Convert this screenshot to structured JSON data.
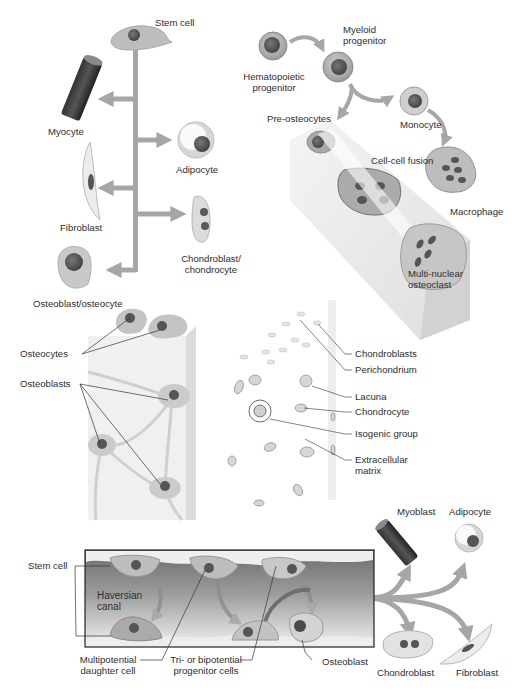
{
  "panel_msc_differentiation": {
    "source": "Stem cell",
    "targets": [
      {
        "label": "Myocyte"
      },
      {
        "label": "Adipocyte"
      },
      {
        "label": "Fibroblast"
      },
      {
        "label": "Chondroblast/",
        "label2": "chondrocyte"
      },
      {
        "label": "Osteoblast/osteocyte"
      }
    ]
  },
  "panel_osteoclast_lineage": {
    "hematopoietic": {
      "line1": "Hematopoietic",
      "line2": "progenitor"
    },
    "myeloid": {
      "line1": "Myeloid",
      "line2": "progenitor"
    },
    "pre_osteocytes": "Pre-osteocytes",
    "monocyte": "Monocyte",
    "fusion": "Cell-cell fusion",
    "macrophage": "Macrophage",
    "osteoclast": {
      "line1": "Multi-nuclear",
      "line2": "osteoclast"
    }
  },
  "panel_bone": {
    "osteocytes": "Osteocytes",
    "osteoblasts": "Osteoblasts"
  },
  "panel_cartilage": {
    "labels": [
      "Chondroblasts",
      "Perichondrium",
      "Lacuna",
      "Chondrocyte",
      "Isogenic group",
      "Extracellular",
      "matrix"
    ]
  },
  "panel_haversian": {
    "stem_cell": "Stem cell",
    "canal": {
      "line1": "Haversian",
      "line2": "canal"
    },
    "multipotential": {
      "line1": "Multipotential",
      "line2": "daughter cell"
    },
    "progenitor": {
      "line1": "Tri- or bipotential",
      "line2": "progenitor cells"
    },
    "osteoblast": "Osteoblast",
    "outputs": [
      "Myoblast",
      "Adipocyte",
      "Chondroblast",
      "Fibroblast"
    ]
  },
  "colors": {
    "arrow": "#a6a6a6",
    "cell_body": "#c4c4c4",
    "nucleus": "#5a5a5a",
    "matrix": "#ececec",
    "text": "#2e2e2e"
  }
}
